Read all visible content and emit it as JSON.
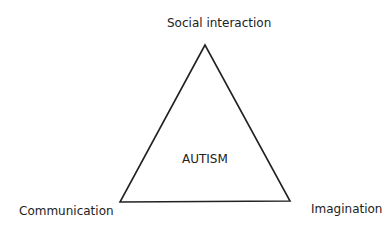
{
  "diagram": {
    "center_label": "AUTISM",
    "vertices": {
      "top": "Social interaction",
      "bottom_left": "Communication",
      "bottom_right": "Imagination"
    },
    "colors": {
      "stroke": "#222222",
      "text": "#222222",
      "background": "#ffffff"
    }
  }
}
